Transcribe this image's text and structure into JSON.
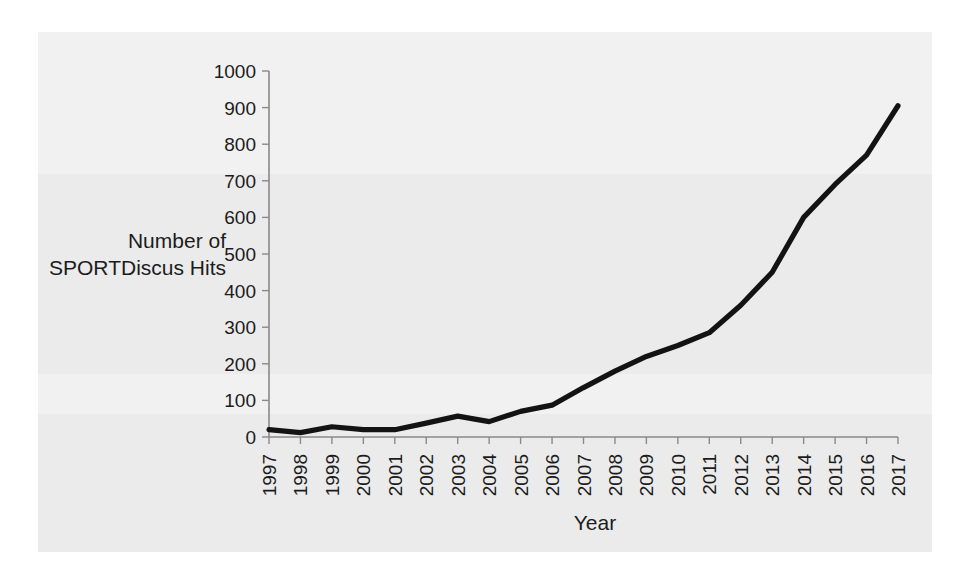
{
  "figure": {
    "background_color": "#ffffff",
    "panel_color": "#ebebeb",
    "line_color": "#131313",
    "axis_color": "#8a8a8a",
    "text_color": "#1c1c1c"
  },
  "chart_data": {
    "type": "line",
    "title": "",
    "xlabel": "Year",
    "ylabel": "Number of SPORTDiscus Hits",
    "ylabel_lines": [
      "Number of",
      "SPORTDiscus Hits"
    ],
    "categories": [
      "1997",
      "1998",
      "1999",
      "2000",
      "2001",
      "2002",
      "2003",
      "2004",
      "2005",
      "2006",
      "2007",
      "2008",
      "2009",
      "2010",
      "2011",
      "2012",
      "2013",
      "2014",
      "2015",
      "2016",
      "2017"
    ],
    "values": [
      20,
      12,
      28,
      20,
      20,
      38,
      57,
      42,
      70,
      87,
      135,
      180,
      220,
      250,
      285,
      360,
      450,
      600,
      690,
      770,
      905
    ],
    "ylim": [
      0,
      1000
    ],
    "yticks": [
      0,
      100,
      200,
      300,
      400,
      500,
      600,
      700,
      800,
      900,
      1000
    ],
    "ytick_labels": [
      "0",
      "100",
      "200",
      "300",
      "400",
      "500",
      "600",
      "700",
      "800",
      "900",
      "1000"
    ],
    "xtick_labels_rotation": -90,
    "grid": false,
    "legend": false,
    "legend_position": "none",
    "series": [
      {
        "name": "SPORTDiscus Hits",
        "values": [
          20,
          12,
          28,
          20,
          20,
          38,
          57,
          42,
          70,
          87,
          135,
          180,
          220,
          250,
          285,
          360,
          450,
          600,
          690,
          770,
          905
        ]
      }
    ]
  }
}
